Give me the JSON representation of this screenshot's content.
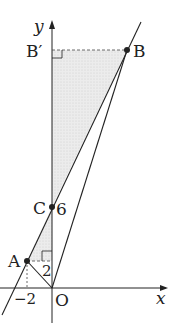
{
  "diagram": {
    "axes": {
      "x_label": "x",
      "y_label": "y"
    },
    "points": {
      "O": {
        "label": "O"
      },
      "A": {
        "label": "A"
      },
      "B": {
        "label": "B"
      },
      "B_prime": {
        "label": "B′"
      },
      "C": {
        "label": "C"
      }
    },
    "ticks": {
      "x_minus2": "−2",
      "y_2": "2",
      "y_6": "6"
    },
    "colors": {
      "line": "#222222",
      "shade": "#e6e6e6"
    }
  }
}
